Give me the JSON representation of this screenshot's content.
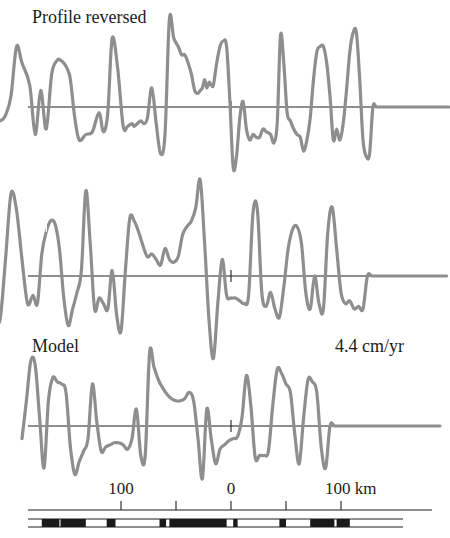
{
  "chart_data": {
    "type": "line",
    "title": "",
    "xlabel": "km",
    "ylabel": "",
    "xlim": [
      -230,
      210
    ],
    "grid": false,
    "legend": "none",
    "x_ticks": [
      {
        "value": -100,
        "label": "100"
      },
      {
        "value": -50,
        "label": ""
      },
      {
        "value": 0,
        "label": "0"
      },
      {
        "value": 50,
        "label": ""
      },
      {
        "value": 100,
        "label": "100 km"
      }
    ],
    "annotations": [
      {
        "text": "Profile reversed",
        "panel": 0,
        "position": "top-left"
      },
      {
        "text": "Model",
        "panel": 2,
        "position": "top-left"
      },
      {
        "text": "4.4 cm/yr",
        "panel": 2,
        "position": "top-right"
      }
    ],
    "panels": [
      {
        "name": "Profile reversed",
        "units": "relative anomaly",
        "x": [
          -220,
          -215,
          -210,
          -205,
          -200,
          -195,
          -190,
          -183,
          -178,
          -173,
          -168,
          -163,
          -158,
          -155,
          -152,
          -149,
          -146,
          -142,
          -138,
          -132,
          -126,
          -120,
          -116,
          -112,
          -108,
          -103,
          -98,
          -94,
          -90,
          -88,
          -85,
          -82,
          -79,
          -76,
          -72,
          -68,
          -64,
          -60,
          -56,
          -52,
          -48,
          -45,
          -42,
          -39,
          -36,
          -33,
          -30,
          -28,
          -26,
          -24,
          -22,
          -20,
          -18,
          -16,
          -13,
          -10,
          -7,
          -4,
          -1,
          2,
          5,
          8,
          11,
          14,
          17,
          20,
          23,
          26,
          29,
          32,
          36,
          39,
          42,
          45,
          48,
          51,
          54,
          57,
          60,
          63,
          66,
          69,
          72,
          75,
          78,
          81,
          84,
          87,
          90,
          93,
          96,
          99,
          102,
          105,
          108,
          111,
          114,
          117,
          120,
          123,
          126,
          129,
          132,
          135,
          138,
          141,
          144,
          147,
          150,
          153,
          156,
          159,
          162,
          165,
          168,
          171,
          174,
          177,
          180,
          183,
          186,
          189,
          192,
          195,
          198
        ],
        "y": [
          -0.3,
          -0.2,
          -0.25,
          -0.15,
          0.2,
          1.1,
          0.8,
          0.4,
          -0.5,
          0.3,
          -0.4,
          0.6,
          0.85,
          0.85,
          0.8,
          0.7,
          0.5,
          -0.2,
          -0.6,
          -0.5,
          -0.45,
          -0.1,
          -0.45,
          -0.1,
          1.25,
          0.7,
          -0.35,
          -0.35,
          -0.3,
          -0.35,
          -0.3,
          -0.25,
          -0.3,
          -0.2,
          0.35,
          -0.3,
          -0.85,
          -0.5,
          1.6,
          1.25,
          1.1,
          0.95,
          0.95,
          0.8,
          0.6,
          0.3,
          0.25,
          0.3,
          0.35,
          0.5,
          0.35,
          0.45,
          0.4,
          0.4,
          0.8,
          1.1,
          1.2,
          1.1,
          0.1,
          -1.1,
          -0.9,
          -0.2,
          0.1,
          -0.4,
          -0.6,
          -0.5,
          -0.55,
          -0.55,
          -0.4,
          -0.45,
          -0.5,
          -0.65,
          -0.3,
          1.3,
          0.8,
          -0.1,
          -0.25,
          -0.4,
          -0.5,
          -0.55,
          -0.8,
          -0.6,
          -0.2,
          0.5,
          1.0,
          1.1,
          1.1,
          0.8,
          0.2,
          -0.6,
          -0.4,
          -0.6,
          -0.3,
          0.3,
          1.0,
          1.35,
          1.35,
          0.5,
          -0.6,
          -0.9,
          -0.85
        ],
        "dashed_gap_x": [
          125,
          132
        ]
      },
      {
        "name": "Observed",
        "units": "relative anomaly",
        "x": [
          -215,
          -210,
          -205,
          -200,
          -195,
          -190,
          -185,
          -180,
          -176,
          -172,
          -168,
          -164,
          -160,
          -156,
          -152,
          -148,
          -144,
          -140,
          -136,
          -132,
          -128,
          -124,
          -120,
          -116,
          -112,
          -108,
          -104,
          -100,
          -96,
          -92,
          -88,
          -84,
          -80,
          -76,
          -72,
          -68,
          -64,
          -60,
          -56,
          -52,
          -48,
          -44,
          -40,
          -36,
          -32,
          -28,
          -24,
          -20,
          -16,
          -12,
          -8,
          -4,
          0,
          4,
          8,
          12,
          16,
          20,
          24,
          28,
          32,
          36,
          40,
          44,
          48,
          52,
          56,
          60,
          64,
          68,
          72,
          76,
          80,
          84,
          88,
          92,
          96,
          100,
          104,
          108,
          112,
          116,
          120,
          124,
          128,
          132,
          136,
          140,
          144,
          148,
          152,
          156,
          160,
          164,
          168,
          172,
          176,
          180,
          184,
          188,
          192,
          196
        ],
        "y": [
          -0.7,
          -0.8,
          0.3,
          1.5,
          1.2,
          0.3,
          -0.5,
          -0.35,
          -0.5,
          0.4,
          0.8,
          1.0,
          0.95,
          0.5,
          -0.4,
          -0.9,
          -0.6,
          -0.3,
          0.1,
          1.55,
          0.6,
          -0.6,
          -0.4,
          -0.5,
          -0.6,
          0.1,
          -0.7,
          -1.0,
          0.1,
          1.05,
          1.0,
          0.8,
          0.55,
          0.35,
          0.4,
          0.3,
          0.2,
          0.5,
          0.3,
          0.25,
          0.35,
          0.75,
          0.9,
          1.0,
          1.25,
          1.75,
          0.6,
          -0.8,
          -1.5,
          -0.5,
          0.3,
          -0.35,
          -0.4,
          -0.4,
          -0.45,
          -0.5,
          -0.35,
          1.15,
          1.2,
          -0.3,
          -0.55,
          -0.3,
          -0.6,
          -0.75,
          -0.2,
          0.5,
          0.85,
          0.9,
          0.6,
          -0.3,
          -0.6,
          0.0,
          -0.5,
          -0.6,
          0.8,
          1.25,
          0.5,
          -0.3,
          -0.5,
          -0.45,
          -0.6,
          -0.55,
          -0.6
        ],
        "dashed_gap_x": [
          -172,
          -166
        ]
      },
      {
        "name": "Model",
        "units": "relative anomaly",
        "x": [
          -190,
          -186,
          -182,
          -178,
          -174,
          -170,
          -166,
          -162,
          -158,
          -154,
          -150,
          -146,
          -142,
          -138,
          -134,
          -130,
          -126,
          -122,
          -118,
          -114,
          -110,
          -106,
          -102,
          -98,
          -94,
          -90,
          -86,
          -82,
          -78,
          -74,
          -70,
          -66,
          -62,
          -58,
          -54,
          -50,
          -46,
          -42,
          -38,
          -34,
          -30,
          -26,
          -22,
          -18,
          -14,
          -10,
          -6,
          -2,
          2,
          6,
          10,
          14,
          18,
          22,
          26,
          30,
          34,
          38,
          42,
          46,
          50,
          54,
          58,
          62,
          66,
          70,
          74,
          78,
          82,
          86,
          90,
          94,
          98,
          102,
          106,
          110,
          114,
          118,
          122,
          126,
          130,
          134,
          138,
          142,
          146,
          150,
          154,
          158,
          162,
          166,
          170,
          174,
          178,
          182,
          186,
          190
        ],
        "y": [
          -0.3,
          0.6,
          1.55,
          1.45,
          0.2,
          -1.0,
          0.6,
          1.15,
          1.05,
          1.0,
          0.8,
          -0.5,
          -1.15,
          -0.85,
          -0.6,
          -0.3,
          1.0,
          0.1,
          -0.6,
          -0.5,
          -0.45,
          -0.4,
          -0.4,
          -0.45,
          -0.55,
          -0.3,
          0.4,
          -0.7,
          -0.7,
          1.75,
          1.4,
          1.1,
          0.9,
          0.75,
          0.65,
          0.6,
          0.6,
          0.65,
          0.8,
          0.6,
          -0.3,
          -1.25,
          0.4,
          -0.3,
          -0.9,
          -0.55,
          -0.45,
          -0.35,
          -0.3,
          -0.25,
          0.2,
          1.2,
          0.5,
          -0.75,
          -0.7,
          -0.7,
          -0.6,
          0.5,
          1.35,
          1.25,
          1.0,
          0.8,
          -0.2,
          -0.9,
          0.2,
          1.1,
          1.05,
          0.8,
          -0.5,
          -1.0
        ],
        "dashed_gap_x": []
      }
    ],
    "magnetization_blocks": {
      "normal_polarity_color": "#1a1a1a",
      "reversed_polarity_color": "#ffffff",
      "normal_ranges_km": [
        [
          -172,
          -156
        ],
        [
          -155,
          -132
        ],
        [
          -113,
          -105
        ],
        [
          -65,
          -59
        ],
        [
          -56,
          -4
        ],
        [
          2,
          6
        ],
        [
          44,
          50
        ],
        [
          72,
          94
        ],
        [
          96,
          108
        ]
      ]
    }
  }
}
